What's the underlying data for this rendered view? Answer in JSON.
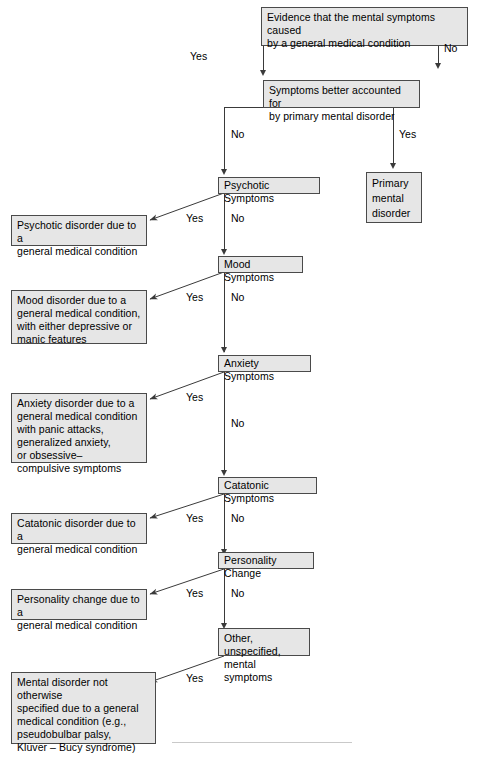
{
  "diagram": {
    "title": "Evidence that the mental symptoms caused by a general medical condition",
    "type": "decision-flowchart",
    "nodes": {
      "evidence": "Evidence that the mental symptoms caused\nby a general medical condition",
      "better_accounted": "Symptoms better accounted for\nby primary mental disorder",
      "primary_mental_disorder": "Primary\nmental\ndisorder",
      "psychotic_symptoms": "Psychotic Symptoms",
      "psychotic_outcome": "Psychotic disorder due to a\ngeneral medical condition",
      "mood_symptoms": "Mood Symptoms",
      "mood_outcome": "Mood disorder due to a\ngeneral medical condition,\nwith either depressive or\nmanic features",
      "anxiety_symptoms": "Anxiety Symptoms",
      "anxiety_outcome": "Anxiety disorder due to a\ngeneral medical condition\nwith panic attacks,\ngeneralized anxiety,\nor obsessive–\ncompulsive symptoms",
      "catatonic_symptoms": "Catatonic Symptoms",
      "catatonic_outcome": "Catatonic disorder due to a\ngeneral medical condition",
      "personality_change": "Personality Change",
      "personality_outcome": "Personality change due to a\ngeneral medical condition",
      "other_symptoms": "Other, unspecified,\nmental symptoms",
      "other_outcome": "Mental disorder not otherwise\nspecified due to a general\nmedical condition (e.g.,\npseudobulbar palsy,\nKlüver – Bucy syndrome)"
    },
    "edge_labels": {
      "evidence_yes": "Yes",
      "evidence_no": "No",
      "better_no": "No",
      "better_yes": "Yes",
      "psychotic_yes": "Yes",
      "psychotic_no": "No",
      "mood_yes": "Yes",
      "mood_no": "No",
      "anxiety_yes": "Yes",
      "anxiety_no": "No",
      "catatonic_yes": "Yes",
      "catatonic_no": "No",
      "personality_yes": "Yes",
      "personality_no": "No",
      "other_yes": "Yes"
    },
    "colors": {
      "node_fill": "#e6e6e6",
      "node_border": "#4a4a4a",
      "line": "#3a3a3a",
      "text": "#000000",
      "background": "#ffffff",
      "footer_rule": "#c9c9c9"
    }
  }
}
